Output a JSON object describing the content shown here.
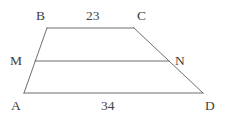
{
  "figure": {
    "kind": "geometry-diagram",
    "shape": "trapezoid",
    "background_color": "#ffffff",
    "stroke_color": "#6e6e6e",
    "text_color": "#404040",
    "vertices": [
      {
        "id": "A",
        "label": "A",
        "x": 24,
        "y": 93
      },
      {
        "id": "B",
        "label": "B",
        "x": 47,
        "y": 28
      },
      {
        "id": "C",
        "label": "C",
        "x": 134,
        "y": 28
      },
      {
        "id": "D",
        "label": "D",
        "x": 203,
        "y": 93
      }
    ],
    "midpoints": [
      {
        "id": "M",
        "label": "M",
        "x": 35,
        "y": 61,
        "on_segment": "AB"
      },
      {
        "id": "N",
        "label": "N",
        "x": 169,
        "y": 61,
        "on_segment": "CD"
      }
    ],
    "edges": [
      {
        "id": "AB",
        "from": "A",
        "to": "B"
      },
      {
        "id": "BC",
        "from": "B",
        "to": "C"
      },
      {
        "id": "CD",
        "from": "C",
        "to": "D"
      },
      {
        "id": "DA",
        "from": "D",
        "to": "A"
      },
      {
        "id": "MN",
        "from": "M",
        "to": "N"
      }
    ],
    "measurements": {
      "top_side": {
        "edge": "BC",
        "value": "23"
      },
      "bottom_side": {
        "edge": "AD",
        "value": "34"
      }
    }
  }
}
